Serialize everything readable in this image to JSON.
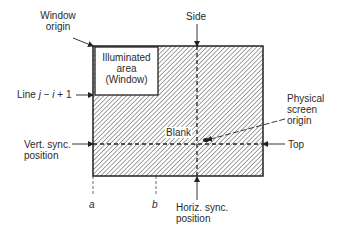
{
  "diagram": {
    "labels": {
      "window_origin_line1": "Window",
      "window_origin_line2": "origin",
      "illuminated_line1": "Illuminated",
      "illuminated_line2": "area",
      "illuminated_line3": "(Window)",
      "line_prefix": "Line ",
      "line_j": "j",
      "line_minus": " − ",
      "line_i": "i",
      "line_suffix": " + 1",
      "side": "Side",
      "physical_line1": "Physical",
      "physical_line2": "screen",
      "physical_line3": "origin",
      "blank": "Blank",
      "vert_sync_line1": "Vert. sync.",
      "vert_sync_line2": "position",
      "top": "Top",
      "a": "a",
      "b": "b",
      "horiz_sync_line1": "Horiz. sync.",
      "horiz_sync_line2": "position"
    },
    "colors": {
      "line": "#222222",
      "hatch": "#555555",
      "background": "#ffffff"
    }
  }
}
